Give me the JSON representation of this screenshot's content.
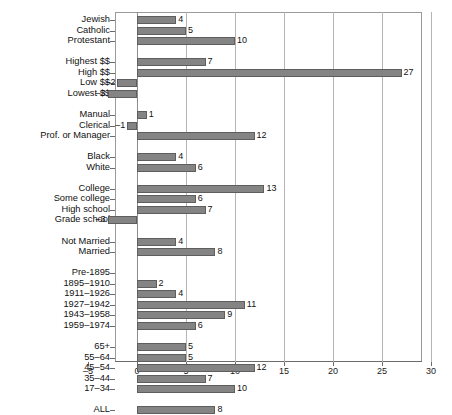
{
  "chart_data": {
    "type": "bar",
    "orientation": "horizontal",
    "title": "",
    "subtitle": "",
    "xlabel": "",
    "ylabel": "",
    "xlim": [
      -5,
      30
    ],
    "xticks": [
      -5,
      0,
      5,
      10,
      15,
      20,
      25,
      30
    ],
    "xtick_labels": [
      "-5",
      "0",
      "5",
      "10",
      "15",
      "20",
      "25",
      "30"
    ],
    "grid": "vertical",
    "legend": "none",
    "bar_color": "#848484",
    "bar_edge_color": "#5e5e5e",
    "categories": [
      "Jewish",
      "Catholic",
      "Protestant",
      "Highest $$",
      "High $$",
      "Low $$",
      "Lowest $$",
      "Manual",
      "Clerical",
      "Prof. or Manager",
      "Black",
      "White",
      "College",
      "Some college",
      "High school",
      "Grade school",
      "Not Married",
      "Married",
      "Pre-1895",
      "1895–1910",
      "1911–1926",
      "1927–1942",
      "1943–1958",
      "1959–1974",
      "65+",
      "55–64",
      "45–54",
      "35–44",
      "17–34",
      "ALL"
    ],
    "values": [
      4,
      5,
      10,
      7,
      27,
      -2,
      -3,
      1,
      -1,
      12,
      4,
      6,
      13,
      6,
      7,
      -3,
      4,
      8,
      0,
      2,
      4,
      11,
      9,
      6,
      5,
      5,
      12,
      7,
      10,
      8
    ],
    "value_labels": [
      "4",
      "5",
      "10",
      "7",
      "27",
      "–2",
      "–3",
      "1",
      "–1",
      "12",
      "4",
      "6",
      "13",
      "6",
      "7",
      "–3",
      "4",
      "8",
      "",
      "2",
      "4",
      "11",
      "9",
      "6",
      "5",
      "5",
      "12",
      "7",
      "10",
      "8"
    ],
    "groups": [
      {
        "name": "religion",
        "categories": [
          "Jewish",
          "Catholic",
          "Protestant"
        ]
      },
      {
        "name": "income",
        "categories": [
          "Highest $$",
          "High $$",
          "Low $$",
          "Lowest $$"
        ]
      },
      {
        "name": "occupation",
        "categories": [
          "Manual",
          "Clerical",
          "Prof. or Manager"
        ]
      },
      {
        "name": "race",
        "categories": [
          "Black",
          "White"
        ]
      },
      {
        "name": "education",
        "categories": [
          "College",
          "Some college",
          "High school",
          "Grade school"
        ]
      },
      {
        "name": "marital-status",
        "categories": [
          "Not Married",
          "Married"
        ]
      },
      {
        "name": "birth-cohort",
        "categories": [
          "Pre-1895",
          "1895–1910",
          "1911–1926",
          "1927–1942",
          "1943–1958",
          "1959–1974"
        ]
      },
      {
        "name": "age",
        "categories": [
          "65+",
          "55–64",
          "45–54",
          "35–44",
          "17–34"
        ]
      },
      {
        "name": "total",
        "categories": [
          "ALL"
        ]
      }
    ]
  }
}
